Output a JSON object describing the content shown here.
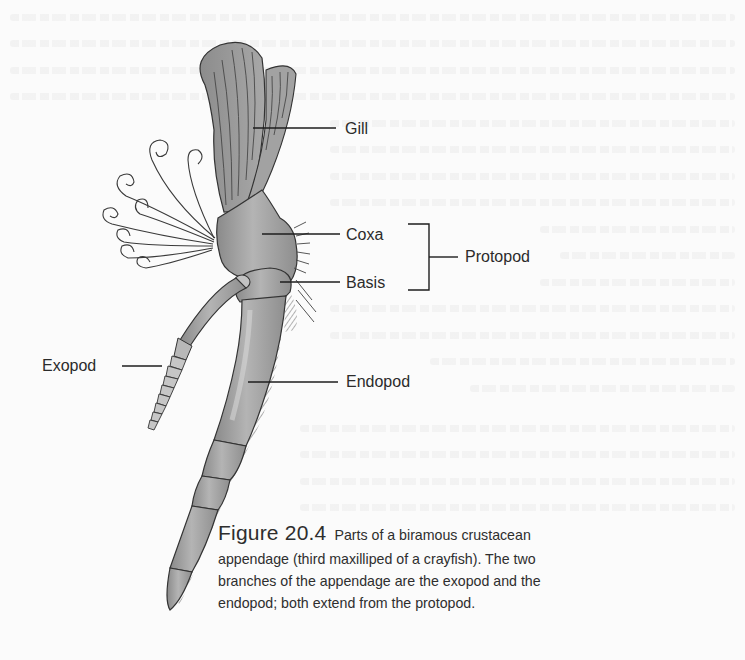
{
  "figure": {
    "number": "Figure 20.4",
    "caption_line1": "Parts of a biramous crustacean",
    "caption_line2": "appendage (third maxilliped of a crayfish). The two",
    "caption_line3": "branches of the appendage are the exopod and the",
    "caption_line4": "endopod; both extend from the protopod."
  },
  "labels": {
    "gill": "Gill",
    "coxa": "Coxa",
    "basis": "Basis",
    "protopod": "Protopod",
    "exopod": "Exopod",
    "endopod": "Endopod"
  },
  "colors": {
    "background": "#fbfbfb",
    "text": "#2b2b2b",
    "appendage_fill": "#9e9e9e",
    "appendage_stroke": "#2a2a2a"
  }
}
